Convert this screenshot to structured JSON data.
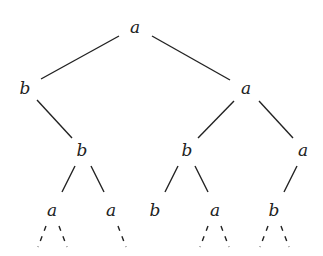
{
  "diagram": {
    "type": "binary tree",
    "nodes": [
      {
        "id": "n0",
        "label": "a",
        "x": 135,
        "y": 27
      },
      {
        "id": "n1",
        "label": "b",
        "x": 25,
        "y": 88
      },
      {
        "id": "n2",
        "label": "a",
        "x": 246,
        "y": 88
      },
      {
        "id": "n3",
        "label": "b",
        "x": 82,
        "y": 150
      },
      {
        "id": "n4",
        "label": "b",
        "x": 187,
        "y": 150
      },
      {
        "id": "n5",
        "label": "a",
        "x": 303,
        "y": 150
      },
      {
        "id": "n6",
        "label": "a",
        "x": 52,
        "y": 210
      },
      {
        "id": "n7",
        "label": "a",
        "x": 111,
        "y": 210
      },
      {
        "id": "n8",
        "label": "b",
        "x": 155,
        "y": 210
      },
      {
        "id": "n9",
        "label": "a",
        "x": 215,
        "y": 210
      },
      {
        "id": "n10",
        "label": "b",
        "x": 274,
        "y": 210
      }
    ],
    "edges": [
      [
        "n0",
        "n1"
      ],
      [
        "n0",
        "n2"
      ],
      [
        "n1",
        "n3"
      ],
      [
        "n2",
        "n4"
      ],
      [
        "n2",
        "n5"
      ],
      [
        "n3",
        "n6"
      ],
      [
        "n3",
        "n7"
      ],
      [
        "n4",
        "n8"
      ],
      [
        "n4",
        "n9"
      ],
      [
        "n5",
        "n10"
      ]
    ],
    "dashed_continuations": [
      {
        "from": "n6",
        "directions": [
          "left",
          "right"
        ]
      },
      {
        "from": "n7",
        "directions": [
          "right"
        ]
      },
      {
        "from": "n9",
        "directions": [
          "left",
          "right"
        ]
      },
      {
        "from": "n10",
        "directions": [
          "left",
          "right"
        ]
      }
    ]
  }
}
